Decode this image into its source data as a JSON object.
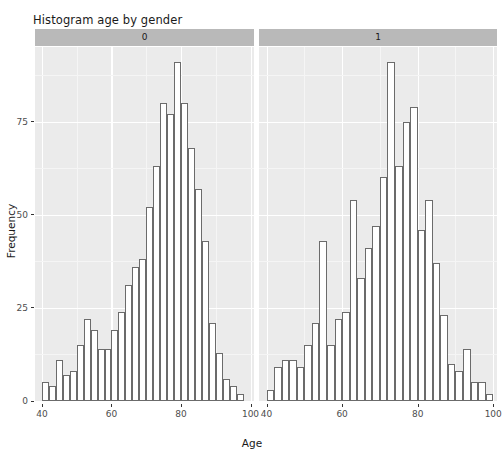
{
  "chart_data": {
    "type": "bar",
    "title": "Histogram age by gender",
    "xlabel": "Age",
    "ylabel": "Frequency",
    "xlim": [
      38,
      101
    ],
    "ylim": [
      0,
      95
    ],
    "xticks": [
      40,
      60,
      80,
      100
    ],
    "yticks": [
      0,
      25,
      50,
      75
    ],
    "grid": true,
    "legend_position": "none",
    "facet_variable": "gender",
    "bin_width": 2,
    "panels": [
      {
        "strip_label": "0",
        "bin_starts": [
          40,
          42,
          44,
          46,
          48,
          50,
          52,
          54,
          56,
          58,
          60,
          62,
          64,
          66,
          68,
          70,
          72,
          74,
          76,
          78,
          80,
          82,
          84,
          86,
          88,
          90,
          92,
          94,
          96
        ],
        "values": [
          5,
          4,
          11,
          7,
          8,
          15,
          22,
          19,
          14,
          14,
          19,
          24,
          31,
          36,
          38,
          52,
          63,
          80,
          77,
          80,
          68,
          57,
          91,
          60,
          43,
          27,
          13,
          11,
          6,
          4,
          2,
          3,
          1
        ]
      },
      {
        "strip_label": "1",
        "bin_starts": [
          40,
          42,
          44,
          46,
          48,
          50,
          52,
          54,
          56,
          58,
          60,
          62,
          64,
          66,
          68,
          70,
          72,
          74,
          76,
          78,
          80,
          82,
          84,
          86,
          88,
          90,
          92,
          94,
          96
        ],
        "values": [
          3,
          9,
          11,
          11,
          9,
          15,
          21,
          43,
          15,
          22,
          24,
          33,
          54,
          41,
          47,
          60,
          91,
          63,
          75,
          79,
          46,
          54,
          37,
          23,
          10,
          8,
          14,
          5,
          5,
          2
        ]
      }
    ]
  },
  "panel_bars": {
    "left": [
      {
        "x0": 40,
        "x1": 42,
        "y": 5
      },
      {
        "x0": 42,
        "x1": 44,
        "y": 4
      },
      {
        "x0": 44,
        "x1": 46,
        "y": 11
      },
      {
        "x0": 46,
        "x1": 48,
        "y": 7
      },
      {
        "x0": 48,
        "x1": 50,
        "y": 8
      },
      {
        "x0": 50,
        "x1": 52,
        "y": 15
      },
      {
        "x0": 52,
        "x1": 54,
        "y": 22
      },
      {
        "x0": 54,
        "x1": 56,
        "y": 19
      },
      {
        "x0": 56,
        "x1": 58,
        "y": 14
      },
      {
        "x0": 58,
        "x1": 60,
        "y": 14
      },
      {
        "x0": 60,
        "x1": 62,
        "y": 19
      },
      {
        "x0": 62,
        "x1": 64,
        "y": 24
      },
      {
        "x0": 64,
        "x1": 66,
        "y": 31
      },
      {
        "x0": 66,
        "x1": 68,
        "y": 36
      },
      {
        "x0": 68,
        "x1": 70,
        "y": 38
      },
      {
        "x0": 70,
        "x1": 72,
        "y": 52
      },
      {
        "x0": 72,
        "x1": 74,
        "y": 63
      },
      {
        "x0": 74,
        "x1": 76,
        "y": 80
      },
      {
        "x0": 76,
        "x1": 78,
        "y": 77
      },
      {
        "x0": 78,
        "x1": 80,
        "y": 91
      },
      {
        "x0": 80,
        "x1": 82,
        "y": 80
      },
      {
        "x0": 82,
        "x1": 84,
        "y": 68
      },
      {
        "x0": 84,
        "x1": 86,
        "y": 57
      },
      {
        "x0": 86,
        "x1": 88,
        "y": 43
      },
      {
        "x0": 88,
        "x1": 90,
        "y": 21
      },
      {
        "x0": 90,
        "x1": 92,
        "y": 13
      },
      {
        "x0": 92,
        "x1": 94,
        "y": 6
      },
      {
        "x0": 94,
        "x1": 96,
        "y": 4
      },
      {
        "x0": 96,
        "x1": 98,
        "y": 2
      }
    ],
    "right": [
      {
        "x0": 40,
        "x1": 42,
        "y": 3
      },
      {
        "x0": 42,
        "x1": 44,
        "y": 9
      },
      {
        "x0": 44,
        "x1": 46,
        "y": 11
      },
      {
        "x0": 46,
        "x1": 48,
        "y": 11
      },
      {
        "x0": 48,
        "x1": 50,
        "y": 9
      },
      {
        "x0": 50,
        "x1": 52,
        "y": 15
      },
      {
        "x0": 52,
        "x1": 54,
        "y": 21
      },
      {
        "x0": 54,
        "x1": 56,
        "y": 43
      },
      {
        "x0": 56,
        "x1": 58,
        "y": 15
      },
      {
        "x0": 58,
        "x1": 60,
        "y": 22
      },
      {
        "x0": 60,
        "x1": 62,
        "y": 24
      },
      {
        "x0": 62,
        "x1": 64,
        "y": 54
      },
      {
        "x0": 64,
        "x1": 66,
        "y": 33
      },
      {
        "x0": 66,
        "x1": 68,
        "y": 41
      },
      {
        "x0": 68,
        "x1": 70,
        "y": 47
      },
      {
        "x0": 70,
        "x1": 72,
        "y": 60
      },
      {
        "x0": 72,
        "x1": 74,
        "y": 91
      },
      {
        "x0": 74,
        "x1": 76,
        "y": 63
      },
      {
        "x0": 76,
        "x1": 78,
        "y": 75
      },
      {
        "x0": 78,
        "x1": 80,
        "y": 79
      },
      {
        "x0": 80,
        "x1": 82,
        "y": 46
      },
      {
        "x0": 82,
        "x1": 84,
        "y": 54
      },
      {
        "x0": 84,
        "x1": 86,
        "y": 37
      },
      {
        "x0": 86,
        "x1": 88,
        "y": 23
      },
      {
        "x0": 88,
        "x1": 90,
        "y": 10
      },
      {
        "x0": 90,
        "x1": 92,
        "y": 8
      },
      {
        "x0": 92,
        "x1": 94,
        "y": 14
      },
      {
        "x0": 94,
        "x1": 96,
        "y": 5
      },
      {
        "x0": 96,
        "x1": 98,
        "y": 5
      },
      {
        "x0": 98,
        "x1": 100,
        "y": 2
      }
    ]
  },
  "style": {
    "panel_background": "#ebebeb",
    "gridline_color": "#ffffff",
    "strip_background": "#b9b9b9",
    "bar_fill": "#ffffff",
    "bar_outline": "#6b6b6b",
    "text_color": "#1a1a1a",
    "tick_label_color": "#4d4d4d"
  }
}
